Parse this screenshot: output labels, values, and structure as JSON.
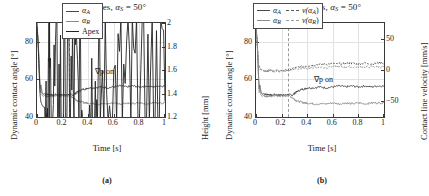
{
  "figure": {
    "caption_a": "(a)",
    "caption_b": "(b)"
  },
  "panel_a": {
    "title_main": "Time series,",
    "title_alpha": "α",
    "title_sub": "S",
    "title_eq": "= 50°",
    "xlabel": "Time [s]",
    "ylabel_left": "Dynamic contact angle [°]",
    "ylabel_right": "Height [mm]",
    "annotation": "∇p on",
    "legend": [
      {
        "label": "α",
        "sub": "A",
        "style": "solid",
        "color": "#4a4a4a"
      },
      {
        "label": "α",
        "sub": "R",
        "style": "solid",
        "color": "#8c8c8c"
      },
      {
        "label": "Apex",
        "sub": "",
        "style": "solid",
        "color": "#222222"
      }
    ]
  },
  "panel_b": {
    "title_main": "Time series,",
    "title_alpha": "α",
    "title_sub": "S",
    "title_eq": "= 50°",
    "xlabel": "Time [s]",
    "ylabel_left": "Dynamic contact angle [°]",
    "ylabel_right": "Contact line velocity [mm/s]",
    "annotation": "∇p on",
    "legend": [
      {
        "label": "α",
        "sub": "A",
        "style": "solid",
        "color": "#4a4a4a",
        "label2": "v(α",
        "sub2": "A",
        "close2": ")",
        "style2": "dashed",
        "color2": "#5a5a5a"
      },
      {
        "label": "α",
        "sub": "R",
        "style": "solid",
        "color": "#8c8c8c",
        "label2": "v(α",
        "sub2": "R",
        "close2": ")",
        "style2": "dashed",
        "color2": "#9a9a9a"
      }
    ]
  },
  "chart_data": [
    {
      "type": "line",
      "panel": "a",
      "title": "Time series, α_S = 50°",
      "xlabel": "Time [s]",
      "ylabel": "Dynamic contact angle [°]",
      "ylabel_right": "Height [mm]",
      "xlim": [
        0,
        1
      ],
      "ylim": [
        40,
        90
      ],
      "ylim_right": [
        1.2,
        2.0
      ],
      "xticks": [
        0,
        0.2,
        0.4,
        0.6,
        0.8,
        1
      ],
      "xticklabels": [
        "0",
        "0.2",
        "0.4",
        "0.6",
        "0.8",
        "1"
      ],
      "yticks": [
        40,
        60,
        80
      ],
      "yticklabels": [
        "40",
        "60",
        "80"
      ],
      "yticks_right": [
        1.2,
        1.4,
        1.6,
        1.8,
        2.0
      ],
      "yticklabels_right": [
        "1.2",
        "1.4",
        "1.6",
        "1.8",
        "2"
      ],
      "grid": true,
      "legend_position": "top-right",
      "annotations": [
        {
          "text": "∇p on",
          "x": 0.46,
          "y": 66
        },
        {
          "text": "vertical dashed line",
          "x": 0.25
        }
      ],
      "series": [
        {
          "name": "α_A",
          "axis": "left",
          "style": "solid",
          "color": "#4a4a4a",
          "x": [
            0,
            0.01,
            0.02,
            0.025,
            0.03,
            0.04,
            0.05,
            0.06,
            0.08,
            0.1,
            0.12,
            0.15,
            0.18,
            0.2,
            0.22,
            0.25,
            0.28,
            0.3,
            0.32,
            0.35,
            0.38,
            0.4,
            0.45,
            0.5,
            0.55,
            0.6,
            0.65,
            0.7,
            0.75,
            0.8,
            0.85,
            0.9,
            0.95,
            1.0
          ],
          "y": [
            88,
            80,
            62,
            55,
            57,
            53,
            52,
            52.5,
            52,
            52,
            51.5,
            52,
            51.5,
            52,
            51.5,
            52,
            51.5,
            52.5,
            53.5,
            54.5,
            55,
            55.5,
            55.5,
            56,
            55.5,
            56,
            56.5,
            56,
            56.5,
            56,
            56.5,
            56,
            56.5,
            56.5
          ]
        },
        {
          "name": "α_R",
          "axis": "left",
          "style": "solid",
          "color": "#8c8c8c",
          "x": [
            0,
            0.01,
            0.02,
            0.025,
            0.03,
            0.04,
            0.05,
            0.06,
            0.08,
            0.1,
            0.12,
            0.15,
            0.18,
            0.2,
            0.22,
            0.25,
            0.28,
            0.3,
            0.32,
            0.35,
            0.38,
            0.4,
            0.45,
            0.5,
            0.55,
            0.6,
            0.65,
            0.7,
            0.75,
            0.8,
            0.85,
            0.9,
            0.95,
            1.0
          ],
          "y": [
            88,
            79,
            60,
            53,
            55,
            51.5,
            51,
            51.5,
            51,
            51,
            51,
            51.5,
            51,
            51.5,
            51,
            51.5,
            50.5,
            49.5,
            48.5,
            48,
            47.5,
            47.5,
            47,
            47,
            47,
            47.5,
            47,
            47.5,
            47,
            47.5,
            47,
            47.5,
            47.5,
            47.5
          ]
        },
        {
          "name": "Apex",
          "axis": "right",
          "style": "solid",
          "color": "#222222",
          "x": [
            0,
            0.01,
            0.02,
            0.025,
            0.03,
            0.04,
            0.05,
            0.06,
            0.08,
            0.1,
            0.15,
            0.2,
            0.25,
            0.3,
            0.35,
            0.4,
            0.45,
            0.5,
            0.6,
            0.7,
            0.8,
            0.9,
            1.0
          ],
          "y": [
            2.0,
            1.78,
            1.5,
            1.38,
            1.33,
            1.3,
            1.285,
            1.283,
            1.285,
            1.29,
            1.3,
            1.305,
            1.31,
            1.315,
            1.32,
            1.325,
            1.325,
            1.33,
            1.33,
            1.335,
            1.33,
            1.335,
            1.335
          ]
        }
      ]
    },
    {
      "type": "line",
      "panel": "b",
      "title": "Time series, α_S = 50°",
      "xlabel": "Time [s]",
      "ylabel": "Dynamic contact angle [°]",
      "ylabel_right": "Contact line velocity [mm/s]",
      "xlim": [
        0,
        1
      ],
      "ylim": [
        40,
        90
      ],
      "ylim_right": [
        -75,
        75
      ],
      "xticks": [
        0,
        0.2,
        0.4,
        0.6,
        0.8,
        1
      ],
      "xticklabels": [
        "0",
        "0.2",
        "0.4",
        "0.6",
        "0.8",
        "1"
      ],
      "yticks": [
        40,
        60,
        80
      ],
      "yticklabels": [
        "40",
        "60",
        "80"
      ],
      "yticks_right": [
        -50,
        0,
        50
      ],
      "yticklabels_right": [
        "−50",
        "0",
        "50"
      ],
      "grid": true,
      "legend_position": "top-center",
      "annotations": [
        {
          "text": "∇p on",
          "x": 0.46,
          "y": 62
        },
        {
          "text": "vertical dashed line",
          "x": 0.25
        }
      ],
      "series": [
        {
          "name": "α_A",
          "axis": "left",
          "style": "solid",
          "color": "#4a4a4a",
          "x": [
            0,
            0.01,
            0.02,
            0.025,
            0.03,
            0.04,
            0.05,
            0.06,
            0.08,
            0.1,
            0.12,
            0.15,
            0.18,
            0.2,
            0.22,
            0.25,
            0.28,
            0.3,
            0.32,
            0.35,
            0.38,
            0.4,
            0.45,
            0.5,
            0.55,
            0.6,
            0.65,
            0.7,
            0.75,
            0.8,
            0.85,
            0.9,
            0.95,
            1.0
          ],
          "y": [
            88,
            80,
            62,
            55,
            57,
            53,
            52,
            52.5,
            52,
            52,
            51.5,
            52,
            51.5,
            52,
            51.5,
            52,
            51.5,
            52.5,
            53.5,
            54.5,
            55,
            55.5,
            55.5,
            56,
            55.5,
            56,
            56.5,
            56,
            56.5,
            56,
            56.5,
            56,
            56.5,
            56.5
          ]
        },
        {
          "name": "α_R",
          "axis": "left",
          "style": "solid",
          "color": "#8c8c8c",
          "x": [
            0,
            0.01,
            0.02,
            0.025,
            0.03,
            0.04,
            0.05,
            0.06,
            0.08,
            0.1,
            0.12,
            0.15,
            0.18,
            0.2,
            0.22,
            0.25,
            0.28,
            0.3,
            0.32,
            0.35,
            0.38,
            0.4,
            0.45,
            0.5,
            0.55,
            0.6,
            0.65,
            0.7,
            0.75,
            0.8,
            0.85,
            0.9,
            0.95,
            1.0
          ],
          "y": [
            88,
            79,
            60,
            53,
            55,
            51.5,
            51,
            51.5,
            51,
            51,
            51,
            51.5,
            51,
            51.5,
            51,
            51.5,
            50.5,
            49.5,
            48.5,
            48,
            47.5,
            47.5,
            47,
            47,
            47,
            47.5,
            47,
            47.5,
            47,
            47.5,
            47,
            47.5,
            47.5,
            47.5
          ]
        },
        {
          "name": "v(α_A)",
          "axis": "right",
          "style": "dashed",
          "color": "#5a5a5a",
          "x": [
            0,
            0.01,
            0.02,
            0.03,
            0.05,
            0.08,
            0.1,
            0.15,
            0.2,
            0.25,
            0.3,
            0.35,
            0.4,
            0.45,
            0.5,
            0.55,
            0.6,
            0.65,
            0.7,
            0.75,
            0.8,
            0.85,
            0.9,
            0.95,
            1.0
          ],
          "y": [
            70,
            40,
            10,
            2,
            0,
            -1,
            -1,
            -1,
            -1,
            0,
            3,
            5,
            7,
            8,
            9,
            9,
            10,
            10,
            10,
            11,
            10,
            11,
            10,
            11,
            11
          ]
        },
        {
          "name": "v(α_R)",
          "axis": "right",
          "style": "dashed",
          "color": "#9a9a9a",
          "x": [
            0,
            0.01,
            0.02,
            0.03,
            0.05,
            0.08,
            0.1,
            0.15,
            0.2,
            0.25,
            0.3,
            0.35,
            0.4,
            0.45,
            0.5,
            0.55,
            0.6,
            0.65,
            0.7,
            0.75,
            0.8,
            0.85,
            0.9,
            0.95,
            1.0
          ],
          "y": [
            70,
            38,
            8,
            1,
            -1,
            -2,
            -2,
            -2,
            -2,
            -1,
            1,
            2,
            3,
            4,
            4,
            4,
            5,
            5,
            5,
            5,
            5,
            5,
            5,
            5,
            5
          ]
        }
      ]
    }
  ]
}
